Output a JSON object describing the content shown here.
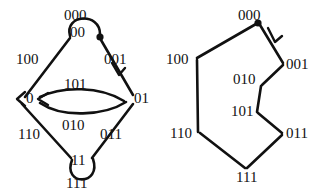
{
  "figure": {
    "background_color": "#ffffff",
    "ink_color": "#111111",
    "panels": [
      {
        "id": "left",
        "name": "de-bruijn-graph",
        "shape": "diamond",
        "nodes": [
          {
            "id": "n00",
            "label": "00",
            "x": 82,
            "y": 33
          },
          {
            "id": "n0",
            "label": "0",
            "x": 29,
            "y": 99
          },
          {
            "id": "n01",
            "label": "01",
            "x": 127,
            "y": 99
          },
          {
            "id": "n11",
            "label": "11",
            "x": 82,
            "y": 161
          }
        ],
        "edge_labels": [
          {
            "id": "e000",
            "label": "000",
            "x": 64,
            "y": 8,
            "note": "self loop on 00"
          },
          {
            "id": "e100",
            "label": "100",
            "x": 16,
            "y": 52
          },
          {
            "id": "e001",
            "label": "001",
            "x": 104,
            "y": 52
          },
          {
            "id": "e101",
            "label": "101",
            "x": 64,
            "y": 77
          },
          {
            "id": "e010",
            "label": "010",
            "x": 62,
            "y": 118
          },
          {
            "id": "e110",
            "label": "110",
            "x": 18,
            "y": 127
          },
          {
            "id": "e011",
            "label": "011",
            "x": 100,
            "y": 127
          },
          {
            "id": "e111",
            "label": "111",
            "x": 66,
            "y": 176,
            "note": "self loop on 11"
          }
        ]
      },
      {
        "id": "right",
        "name": "eulerian-cycle",
        "shape": "hexagonal-cycle",
        "vertex_labels": [
          {
            "id": "v000",
            "label": "000",
            "x": 230,
            "y": 8
          },
          {
            "id": "v100",
            "label": "100",
            "x": 168,
            "y": 52
          },
          {
            "id": "v001",
            "label": "001",
            "x": 281,
            "y": 57
          },
          {
            "id": "v010",
            "label": "010",
            "x": 236,
            "y": 77
          },
          {
            "id": "v101",
            "label": "101",
            "x": 236,
            "y": 108
          },
          {
            "id": "v110",
            "label": "110",
            "x": 172,
            "y": 127
          },
          {
            "id": "v011",
            "label": "011",
            "x": 281,
            "y": 127
          },
          {
            "id": "v111",
            "label": "111",
            "x": 237,
            "y": 171
          }
        ]
      }
    ],
    "markers": {
      "start_dot_left": {
        "x": 100,
        "y": 38
      },
      "start_dot_right": {
        "x": 258,
        "y": 22
      },
      "arrow_left_001": {
        "x": 118,
        "y": 72
      },
      "arrow_right_001": {
        "x": 275,
        "y": 40
      },
      "arrow_into_node_0": {
        "x": 39,
        "y": 99
      }
    }
  }
}
